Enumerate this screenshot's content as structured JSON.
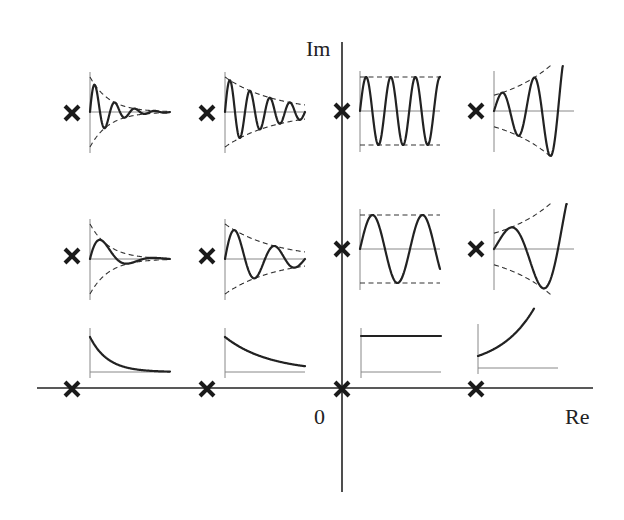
{
  "diagram": {
    "axes": {
      "real_label": "Re",
      "imag_label": "Im",
      "origin_label": "0"
    },
    "pole_marker": "cross",
    "columns": [
      "far-left-half-plane",
      "near-left-half-plane",
      "imaginary-axis",
      "right-half-plane"
    ],
    "rows": [
      "high-frequency",
      "low-frequency",
      "real-axis"
    ],
    "responses": [
      {
        "row": 0,
        "col": 0,
        "type": "damped-oscillation",
        "decay": "fast",
        "cycles": 4,
        "envelope": "dashed"
      },
      {
        "row": 0,
        "col": 1,
        "type": "damped-oscillation",
        "decay": "slow",
        "cycles": 4,
        "envelope": "dashed"
      },
      {
        "row": 0,
        "col": 2,
        "type": "sustained-oscillation",
        "decay": "none",
        "cycles": 3.25,
        "envelope": "dashed"
      },
      {
        "row": 0,
        "col": 3,
        "type": "growing-oscillation",
        "decay": "growth",
        "cycles": 2.5,
        "envelope": "dashed"
      },
      {
        "row": 1,
        "col": 0,
        "type": "damped-oscillation",
        "decay": "fast",
        "cycles": 1.5,
        "envelope": "dashed"
      },
      {
        "row": 1,
        "col": 1,
        "type": "damped-oscillation",
        "decay": "slow",
        "cycles": 2,
        "envelope": "dashed"
      },
      {
        "row": 1,
        "col": 2,
        "type": "sustained-oscillation",
        "decay": "none",
        "cycles": 1.6,
        "envelope": "dashed"
      },
      {
        "row": 1,
        "col": 3,
        "type": "growing-oscillation",
        "decay": "growth",
        "cycles": 1.25,
        "envelope": "dashed"
      },
      {
        "row": 2,
        "col": 0,
        "type": "exponential-decay",
        "decay": "fast",
        "cycles": 0,
        "envelope": "none"
      },
      {
        "row": 2,
        "col": 1,
        "type": "exponential-decay",
        "decay": "slow",
        "cycles": 0,
        "envelope": "none"
      },
      {
        "row": 2,
        "col": 2,
        "type": "constant",
        "decay": "none",
        "cycles": 0,
        "envelope": "none"
      },
      {
        "row": 2,
        "col": 3,
        "type": "exponential-growth",
        "decay": "growth",
        "cycles": 0,
        "envelope": "none"
      }
    ]
  }
}
